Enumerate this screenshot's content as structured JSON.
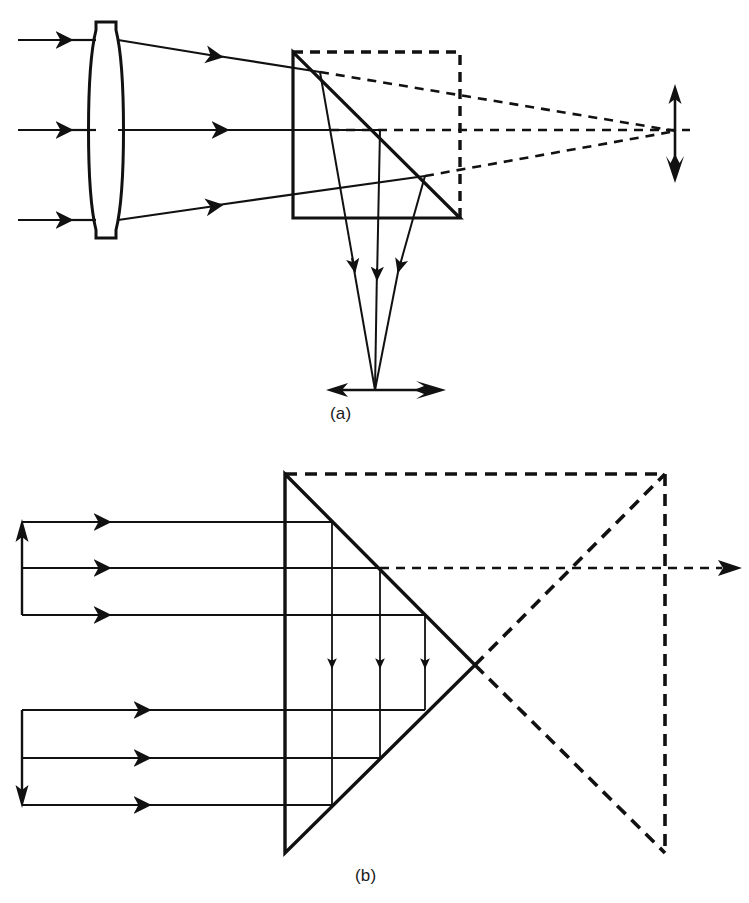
{
  "figure": {
    "kind": "optics-ray-diagram",
    "background_color": "#ffffff",
    "ink_color": "#111111",
    "width": 749,
    "height": 903,
    "panels": [
      {
        "id": "a",
        "label": "(a)",
        "label_position": {
          "x": 330,
          "y": 404
        },
        "description": "Converging lens focusing a beam into a right-angle prism; reflected real image below, virtual image to the right",
        "components": [
          {
            "name": "biconvex-lens",
            "type": "lens",
            "center_x": 106,
            "top_y": 22,
            "bottom_y": 238,
            "half_thickness": 14
          },
          {
            "name": "right-angle-prism",
            "type": "triangle",
            "vertices": [
              [
                293,
                52
              ],
              [
                293,
                218
              ],
              [
                460,
                218
              ]
            ],
            "stroke_width": 3.2
          },
          {
            "name": "virtual-prism-outline",
            "type": "dashed-square",
            "x": 293,
            "y": 52,
            "width": 167,
            "height": 166,
            "dash": "9 7",
            "stroke_width": 3.2
          },
          {
            "name": "incoming-ray-top",
            "type": "ray",
            "points": [
              [
                18,
                40
              ],
              [
                106,
                40
              ]
            ],
            "arrow_at": 0.62
          },
          {
            "name": "incoming-ray-middle",
            "type": "ray",
            "points": [
              [
                18,
                130
              ],
              [
                106,
                130
              ]
            ],
            "arrow_at": 0.62
          },
          {
            "name": "incoming-ray-bottom",
            "type": "ray",
            "points": [
              [
                18,
                220
              ],
              [
                106,
                220
              ]
            ],
            "arrow_at": 0.62
          },
          {
            "name": "refracted-ray-top",
            "type": "ray",
            "points": [
              [
                120,
                40
              ],
              [
                320,
                72
              ]
            ],
            "arrow_at": 0.6
          },
          {
            "name": "refracted-ray-middle",
            "type": "ray",
            "points": [
              [
                120,
                130
              ],
              [
                380,
                130
              ]
            ],
            "arrow_at": 0.48
          },
          {
            "name": "refracted-ray-bottom",
            "type": "ray",
            "points": [
              [
                120,
                220
              ],
              [
                425,
                176
              ]
            ],
            "arrow_at": 0.55
          },
          {
            "name": "folded-ray-top",
            "type": "ray",
            "points": [
              [
                320,
                72
              ],
              [
                375,
                390
              ]
            ],
            "arrow_at": 0.47
          },
          {
            "name": "folded-ray-middle",
            "type": "ray",
            "points": [
              [
                380,
                130
              ],
              [
                375,
                390
              ]
            ],
            "arrow_at": 0.47
          },
          {
            "name": "folded-ray-bottom",
            "type": "ray",
            "points": [
              [
                425,
                176
              ],
              [
                375,
                390
              ]
            ],
            "arrow_at": 0.47
          },
          {
            "name": "virtual-ray-top",
            "type": "dashed-ray",
            "points": [
              [
                320,
                72
              ],
              [
                676,
                131
              ]
            ]
          },
          {
            "name": "virtual-ray-axis",
            "type": "dashed-ray",
            "points": [
              [
                380,
                130
              ],
              [
                690,
                130
              ]
            ]
          },
          {
            "name": "virtual-ray-bottom",
            "type": "dashed-ray",
            "points": [
              [
                425,
                176
              ],
              [
                676,
                131
              ]
            ]
          },
          {
            "name": "virtual-image-arrow",
            "type": "double-arrow-vertical",
            "x": 675,
            "top_y": 86,
            "bottom_y": 181
          },
          {
            "name": "real-image-arrow",
            "type": "double-arrow-horizontal",
            "y": 390,
            "left_x": 328,
            "right_x": 443
          }
        ]
      },
      {
        "id": "b",
        "label": "(b)",
        "label_position": {
          "x": 355,
          "y": 866
        },
        "description": "Retroreflecting roof prism: parallel beam enters, is folded twice and returns antiparallel; dashed unfolded equivalent on the right",
        "components": [
          {
            "name": "roof-prism",
            "type": "triangle",
            "vertices": [
              [
                285,
                474
              ],
              [
                475,
                665
              ],
              [
                285,
                853
              ]
            ],
            "stroke_width": 3.4
          },
          {
            "name": "unfolded-prism-outline",
            "type": "dashed-triangle",
            "vertices": [
              [
                285,
                474
              ],
              [
                665,
                474
              ],
              [
                665,
                853
              ],
              [
                475,
                665
              ]
            ],
            "dash": "11 8",
            "stroke_width": 3.4
          },
          {
            "name": "optical-axis-dashed",
            "type": "dashed-ray",
            "points": [
              [
                380,
                568
              ],
              [
                740,
                568
              ]
            ]
          },
          {
            "name": "entry-ray-1",
            "type": "ray",
            "points": [
              [
                22,
                522
              ],
              [
                380,
                522
              ]
            ],
            "arrow_at": 0.26
          },
          {
            "name": "entry-ray-2",
            "type": "ray",
            "points": [
              [
                22,
                568
              ],
              [
                380,
                568
              ]
            ],
            "arrow_at": 0.26
          },
          {
            "name": "entry-ray-3",
            "type": "ray",
            "points": [
              [
                22,
                615
              ],
              [
                425,
                615
              ]
            ],
            "arrow_at": 0.26
          },
          {
            "name": "fold-ray-1",
            "type": "ray",
            "points": [
              [
                332,
                522
              ],
              [
                332,
                805
              ]
            ],
            "arrow_at": 0.43
          },
          {
            "name": "fold-ray-2",
            "type": "ray",
            "points": [
              [
                380,
                568
              ],
              [
                380,
                758
              ]
            ],
            "arrow_at": 0.43
          },
          {
            "name": "fold-ray-3",
            "type": "ray",
            "points": [
              [
                425,
                615
              ],
              [
                425,
                710
              ]
            ],
            "arrow_at": 0.43
          },
          {
            "name": "exit-ray-1",
            "type": "ray",
            "points": [
              [
                425,
                710
              ],
              [
                22,
                710
              ]
            ],
            "arrow_at": 0.74
          },
          {
            "name": "exit-ray-2",
            "type": "ray",
            "points": [
              [
                380,
                758
              ],
              [
                22,
                758
              ]
            ],
            "arrow_at": 0.74
          },
          {
            "name": "exit-ray-3",
            "type": "ray",
            "points": [
              [
                332,
                805
              ],
              [
                22,
                805
              ]
            ],
            "arrow_at": 0.74
          },
          {
            "name": "input-bracket-arrow-up",
            "type": "arrow-vertical-up",
            "x": 22,
            "from_y": 615,
            "to_y": 522
          },
          {
            "name": "output-bracket-arrow-down",
            "type": "arrow-vertical-down",
            "x": 22,
            "from_y": 710,
            "to_y": 805
          },
          {
            "name": "axis-exit-arrow",
            "type": "arrow-head-right",
            "x": 740,
            "y": 568
          }
        ]
      }
    ]
  }
}
